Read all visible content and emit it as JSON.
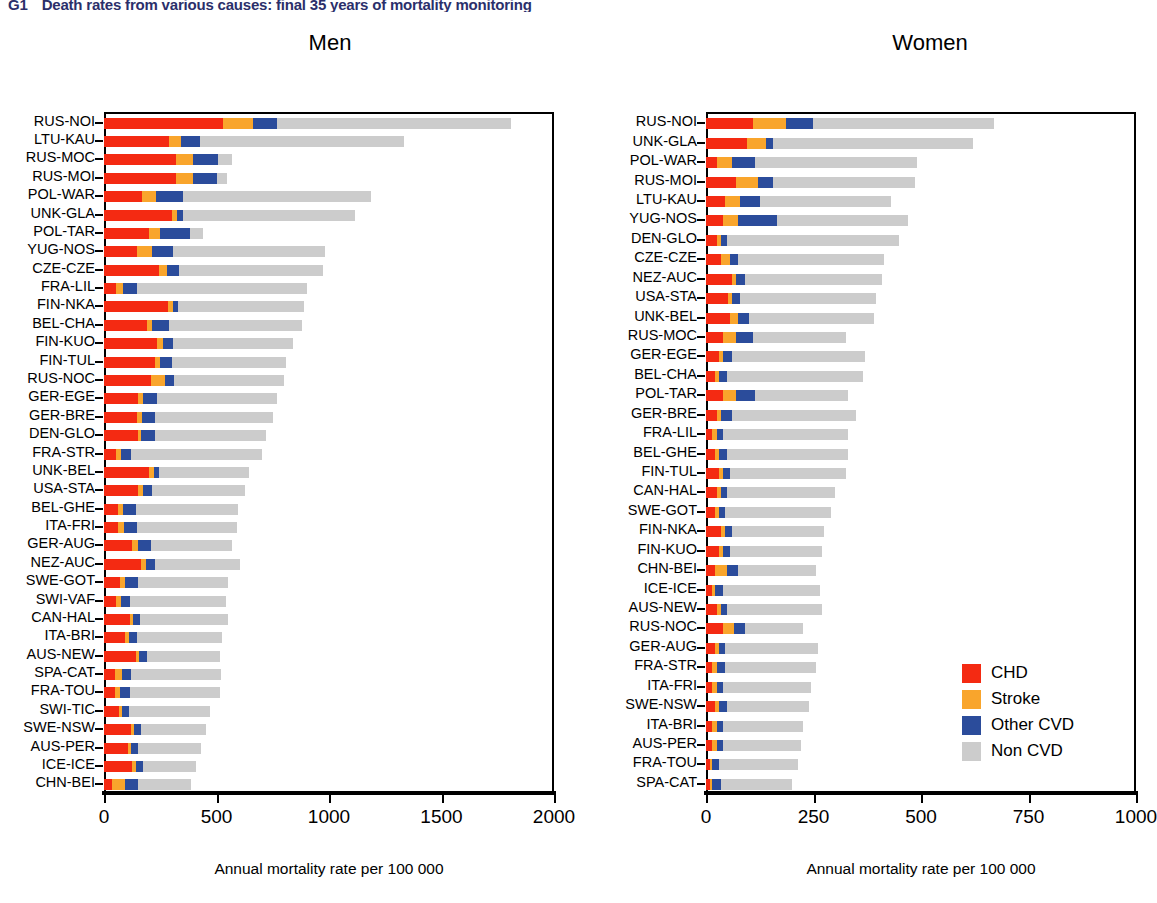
{
  "figure": {
    "number": "G1",
    "title": "Death rates from various causes: final 35 years of mortality monitoring",
    "men_title": "Men",
    "women_title": "Women",
    "xaxis_title": "Annual mortality rate per 100 000"
  },
  "legend": {
    "items": [
      {
        "key": "chd",
        "label": "CHD",
        "color": "#f42a12"
      },
      {
        "key": "stroke",
        "label": "Stroke",
        "color": "#f9a52c"
      },
      {
        "key": "ocvd",
        "label": "Other CVD",
        "color": "#2b4c9b"
      },
      {
        "key": "noncvd",
        "label": "Non CVD",
        "color": "#cccccc"
      }
    ]
  },
  "chart_data": {
    "type": "bar",
    "orientation": "horizontal",
    "stacked": true,
    "title": "Death rates from various causes: final 35 years of mortality monitoring",
    "xlabel": "Annual mortality rate per 100 000",
    "ylabel": "",
    "series_names": [
      "CHD",
      "Stroke",
      "Other CVD",
      "Non CVD"
    ],
    "series_colors": [
      "#f42a12",
      "#f9a52c",
      "#2b4c9b",
      "#cccccc"
    ],
    "grid": false,
    "legend_position": "bottom-right",
    "panels": [
      {
        "name": "Men",
        "xlim": [
          0,
          2000
        ],
        "xticks": [
          0,
          500,
          1000,
          1500,
          2000
        ],
        "categories": [
          "RUS-NOI",
          "LTU-KAU",
          "RUS-MOC",
          "RUS-MOI",
          "POL-WAR",
          "UNK-GLA",
          "POL-TAR",
          "YUG-NOS",
          "CZE-CZE",
          "FRA-LIL",
          "FIN-NKA",
          "BEL-CHA",
          "FIN-KUO",
          "FIN-TUL",
          "RUS-NOC",
          "GER-EGE",
          "GER-BRE",
          "DEN-GLO",
          "FRA-STR",
          "UNK-BEL",
          "USA-STA",
          "BEL-GHE",
          "ITA-FRI",
          "GER-AUG",
          "NEZ-AUC",
          "SWE-GOT",
          "SWI-VAF",
          "CAN-HAL",
          "ITA-BRI",
          "AUS-NEW",
          "SPA-CAT",
          "FRA-TOU",
          "SWI-TIC",
          "SWE-NSW",
          "AUS-PER",
          "ICE-ICE",
          "CHN-BEI"
        ],
        "series": [
          {
            "name": "CHD",
            "values": [
              530,
              290,
              320,
              320,
              170,
              300,
              200,
              145,
              245,
              55,
              285,
              190,
              235,
              225,
              210,
              150,
              145,
              150,
              55,
              200,
              150,
              60,
              60,
              125,
              165,
              70,
              55,
              115,
              95,
              140,
              50,
              50,
              65,
              120,
              105,
              125,
              35
            ]
          },
          {
            "name": "Stroke",
            "values": [
              130,
              50,
              75,
              75,
              60,
              25,
              50,
              70,
              35,
              30,
              20,
              25,
              25,
              25,
              60,
              25,
              25,
              15,
              20,
              20,
              25,
              25,
              30,
              25,
              20,
              25,
              20,
              15,
              15,
              15,
              30,
              20,
              15,
              15,
              15,
              15,
              60
            ]
          },
          {
            "name": "Other CVD",
            "values": [
              110,
              85,
              110,
              105,
              120,
              25,
              130,
              90,
              55,
              60,
              25,
              75,
              45,
              50,
              40,
              60,
              55,
              60,
              45,
              25,
              40,
              55,
              55,
              60,
              40,
              55,
              40,
              30,
              35,
              35,
              40,
              45,
              30,
              30,
              30,
              35,
              55
            ]
          },
          {
            "name": "Non CVD",
            "values": [
              1040,
              910,
              65,
              45,
              835,
              765,
              60,
              675,
              640,
              755,
              560,
              590,
              535,
              510,
              490,
              535,
              525,
              495,
              580,
              400,
              410,
              455,
              445,
              360,
              380,
              400,
              425,
              390,
              380,
              325,
              400,
              400,
              360,
              290,
              280,
              235,
              235
            ]
          }
        ]
      },
      {
        "name": "Women",
        "xlim": [
          0,
          1000
        ],
        "xticks": [
          0,
          250,
          500,
          750,
          1000
        ],
        "categories": [
          "RUS-NOI",
          "UNK-GLA",
          "POL-WAR",
          "RUS-MOI",
          "LTU-KAU",
          "YUG-NOS",
          "DEN-GLO",
          "CZE-CZE",
          "NEZ-AUC",
          "USA-STA",
          "UNK-BEL",
          "RUS-MOC",
          "GER-EGE",
          "BEL-CHA",
          "POL-TAR",
          "GER-BRE",
          "FRA-LIL",
          "BEL-GHE",
          "FIN-TUL",
          "CAN-HAL",
          "SWE-GOT",
          "FIN-NKA",
          "FIN-KUO",
          "CHN-BEI",
          "ICE-ICE",
          "AUS-NEW",
          "RUS-NOC",
          "GER-AUG",
          "FRA-STR",
          "ITA-FRI",
          "SWE-NSW",
          "ITA-BRI",
          "AUS-PER",
          "FRA-TOU",
          "SPA-CAT"
        ],
        "series": [
          {
            "name": "CHD",
            "values": [
              110,
              95,
              25,
              70,
              45,
              40,
              25,
              35,
              60,
              50,
              55,
              40,
              30,
              20,
              40,
              25,
              15,
              20,
              30,
              25,
              20,
              35,
              30,
              20,
              15,
              25,
              40,
              20,
              15,
              15,
              20,
              15,
              15,
              10,
              10
            ]
          },
          {
            "name": "Stroke",
            "values": [
              75,
              45,
              35,
              50,
              35,
              35,
              10,
              20,
              10,
              10,
              20,
              30,
              10,
              10,
              30,
              10,
              10,
              10,
              10,
              10,
              10,
              10,
              10,
              30,
              5,
              10,
              25,
              10,
              10,
              10,
              10,
              10,
              10,
              5,
              5
            ]
          },
          {
            "name": "Other CVD",
            "values": [
              65,
              15,
              55,
              35,
              45,
              90,
              15,
              20,
              20,
              20,
              25,
              40,
              20,
              20,
              45,
              25,
              15,
              20,
              15,
              15,
              15,
              15,
              15,
              25,
              20,
              15,
              25,
              15,
              20,
              15,
              20,
              15,
              15,
              15,
              20
            ]
          },
          {
            "name": "Non CVD",
            "values": [
              420,
              465,
              375,
              330,
              305,
              305,
              400,
              340,
              320,
              315,
              290,
              215,
              310,
              315,
              215,
              290,
              290,
              280,
              270,
              250,
              245,
              215,
              215,
              180,
              225,
              220,
              135,
              215,
              210,
              205,
              190,
              185,
              180,
              185,
              165
            ]
          }
        ]
      }
    ]
  }
}
